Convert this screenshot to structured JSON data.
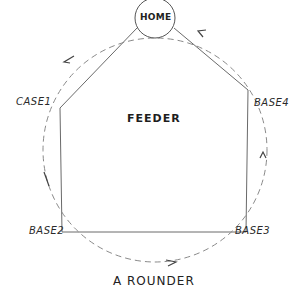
{
  "diagram": {
    "title": "A ROUNDER",
    "center_label": "FEEDER",
    "nodes": [
      {
        "id": "home",
        "label": "HOME"
      },
      {
        "id": "case1",
        "label": "CASE1"
      },
      {
        "id": "base2",
        "label": "BASE2"
      },
      {
        "id": "base3",
        "label": "BASE3"
      },
      {
        "id": "base4",
        "label": "BASE4"
      }
    ],
    "edges": [
      {
        "from": "HOME",
        "to": "CASE1",
        "style": "solid"
      },
      {
        "from": "CASE1",
        "to": "BASE2",
        "style": "solid"
      },
      {
        "from": "BASE2",
        "to": "BASE3",
        "style": "solid"
      },
      {
        "from": "BASE3",
        "to": "BASE4",
        "style": "solid"
      },
      {
        "from": "BASE4",
        "to": "HOME",
        "style": "solid"
      }
    ],
    "route": {
      "style": "dashed",
      "direction": "HOME → CASE1 → BASE2 → BASE3 → BASE4 → HOME"
    },
    "colors": {
      "line": "#555555",
      "text": "#222222",
      "background": "#ffffff"
    }
  }
}
